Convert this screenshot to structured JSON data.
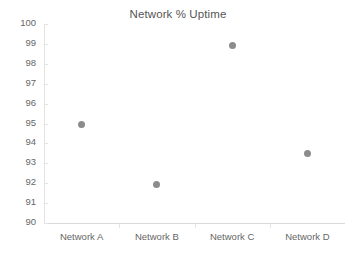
{
  "chart_data": {
    "type": "scatter",
    "title": "Network % Uptime",
    "xlabel": "",
    "ylabel": "",
    "categories": [
      "Network A",
      "Network B",
      "Network C",
      "Network D"
    ],
    "values": [
      94.95,
      91.95,
      98.9,
      93.5
    ],
    "series": [
      {
        "name": "Network % Uptime",
        "values": [
          94.95,
          91.95,
          98.9,
          93.5
        ]
      }
    ],
    "ylim": [
      90,
      100
    ],
    "ytick_labels": [
      "100",
      "99",
      "98",
      "97",
      "96",
      "95",
      "94",
      "93",
      "92",
      "91",
      "90"
    ],
    "ytick_values": [
      100,
      99,
      98,
      97,
      96,
      95,
      94,
      93,
      92,
      91,
      90
    ],
    "grid": false,
    "legend": "none",
    "marker_color": "#8c8c8c",
    "axis_color": "#e4e4e4",
    "text_color": "#666666",
    "title_color": "#555555",
    "background": "#ffffff"
  }
}
